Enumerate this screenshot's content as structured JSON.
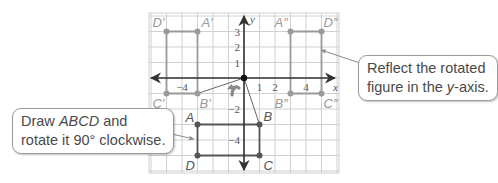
{
  "figure": {
    "grid": {
      "x_min": -6,
      "x_max": 6,
      "y_min": -6,
      "y_max": 4,
      "origin_px": [
        244,
        78
      ],
      "unit_px": 15.5
    },
    "axes": {
      "x_label": "x",
      "y_label": "y",
      "x_ticks": [
        {
          "value": -4,
          "label": "−4"
        },
        {
          "value": 1,
          "label": "1"
        },
        {
          "value": 2,
          "label": "2"
        },
        {
          "value": 4,
          "label": "4"
        }
      ],
      "y_ticks": [
        {
          "value": 3,
          "label": "3"
        },
        {
          "value": 2,
          "label": "2"
        },
        {
          "value": 1,
          "label": "1"
        },
        {
          "value": -2,
          "label": "−2"
        },
        {
          "value": -4,
          "label": "−4"
        }
      ]
    },
    "shapes": [
      {
        "name": "original-ABCD",
        "color": "#555555",
        "vertices": [
          {
            "label": "A",
            "x": -3,
            "y": -3,
            "label_dx": -12,
            "label_dy": -3
          },
          {
            "label": "B",
            "x": 1,
            "y": -3,
            "label_dx": 4,
            "label_dy": -4
          },
          {
            "label": "C",
            "x": 1,
            "y": -5,
            "label_dx": 4,
            "label_dy": 14
          },
          {
            "label": "D",
            "x": -3,
            "y": -5,
            "label_dx": -12,
            "label_dy": 14
          }
        ]
      },
      {
        "name": "rotated-A'B'C'D'",
        "color": "#9a9a9a",
        "vertices": [
          {
            "label": "A′",
            "x": -3,
            "y": 3,
            "label_dx": 4,
            "label_dy": -5
          },
          {
            "label": "B′",
            "x": -3,
            "y": -1,
            "label_dx": 2,
            "label_dy": 14
          },
          {
            "label": "C′",
            "x": -5,
            "y": -1,
            "label_dx": -14,
            "label_dy": 14
          },
          {
            "label": "D′",
            "x": -5,
            "y": 3,
            "label_dx": -14,
            "label_dy": -5
          }
        ]
      },
      {
        "name": "reflected-A''B''C''D''",
        "color": "#9a9a9a",
        "vertices": [
          {
            "label": "A″",
            "x": 3,
            "y": 3,
            "label_dx": -16,
            "label_dy": -5
          },
          {
            "label": "B″",
            "x": 3,
            "y": -1,
            "label_dx": -16,
            "label_dy": 14
          },
          {
            "label": "C″",
            "x": 5,
            "y": -1,
            "label_dx": 2,
            "label_dy": 14
          },
          {
            "label": "D″",
            "x": 5,
            "y": 3,
            "label_dx": 2,
            "label_dy": -5
          }
        ]
      }
    ],
    "rotation_rays": [
      {
        "from": [
          0,
          0
        ],
        "to": [
          -3,
          -1
        ]
      },
      {
        "from": [
          0,
          0
        ],
        "to": [
          1,
          -3
        ]
      }
    ],
    "rotation_arrow": "counterclockwise-arrow-glyph",
    "colors": {
      "grid": "#d0d0d0",
      "axis": "#333333",
      "original": "#555555",
      "image": "#9a9a9a",
      "text": "#555555",
      "leader": "#8a8a8a"
    }
  },
  "callouts": {
    "left": {
      "line1_prefix": "Draw ",
      "line1_italic": "ABCD",
      "line1_suffix": " and",
      "line2": "rotate it 90° clockwise."
    },
    "right": {
      "line1": "Reflect the rotated",
      "line2_prefix": "figure in the ",
      "line2_italic": "y",
      "line2_suffix": "-axis."
    }
  }
}
